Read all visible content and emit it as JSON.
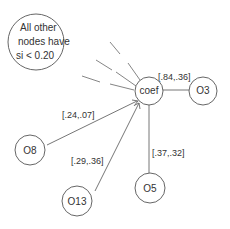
{
  "note": {
    "lines": [
      "All other",
      "nodes have",
      "si < 0.20"
    ]
  },
  "center_node": {
    "id": "coef",
    "label": "coef"
  },
  "nodes": [
    {
      "id": "O3",
      "label": "O3",
      "edge_label": "[.84,.36]"
    },
    {
      "id": "O8",
      "label": "O8",
      "edge_label": "[.24,.07]"
    },
    {
      "id": "O13",
      "label": "O13",
      "edge_label": "[.29,.36]"
    },
    {
      "id": "O5",
      "label": "O5",
      "edge_label": "[.37,.32]"
    }
  ],
  "colors": {
    "stroke": "#555555",
    "text": "#333333",
    "background": "#ffffff"
  }
}
